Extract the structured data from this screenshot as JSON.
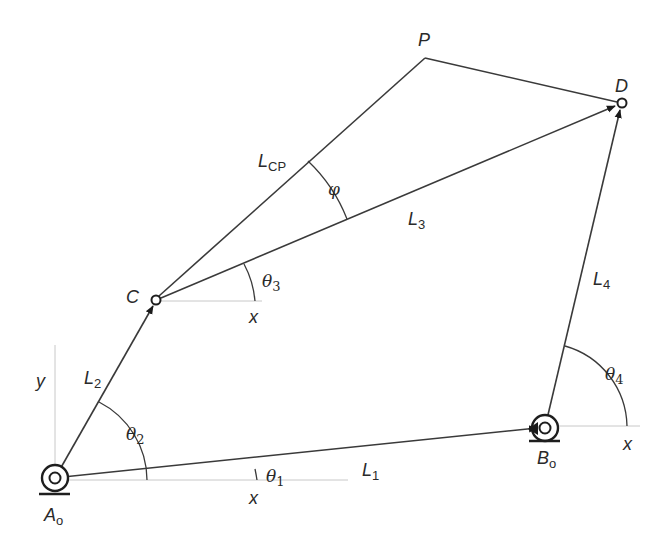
{
  "diagram": {
    "points": {
      "A0": {
        "label": "A",
        "sub": "o",
        "x": 55,
        "y": 478
      },
      "B0": {
        "label": "B",
        "sub": "o",
        "x": 545,
        "y": 428
      },
      "C": {
        "label": "C",
        "x": 156,
        "y": 300
      },
      "D": {
        "label": "D",
        "x": 622,
        "y": 103
      },
      "P": {
        "label": "P",
        "x": 425,
        "y": 58
      }
    },
    "links": [
      {
        "id": "L1",
        "label": "L",
        "sub": "1",
        "from": "A0",
        "to": "B0"
      },
      {
        "id": "L2",
        "label": "L",
        "sub": "2",
        "from": "A0",
        "to": "C"
      },
      {
        "id": "L3",
        "label": "L",
        "sub": "3",
        "from": "C",
        "to": "D"
      },
      {
        "id": "L4",
        "label": "L",
        "sub": "4",
        "from": "B0",
        "to": "D"
      },
      {
        "id": "LCP",
        "label": "L",
        "sub": "CP",
        "from": "C",
        "to": "P"
      },
      {
        "id": "PD",
        "label": "",
        "from": "P",
        "to": "D"
      }
    ],
    "angles": [
      {
        "symbol": "θ",
        "sub": "1"
      },
      {
        "symbol": "θ",
        "sub": "2"
      },
      {
        "symbol": "θ",
        "sub": "3"
      },
      {
        "symbol": "θ",
        "sub": "4"
      },
      {
        "symbol": "φ",
        "sub": ""
      }
    ],
    "axes": {
      "x_label": "x",
      "y_label": "y"
    },
    "colors": {
      "line": "#3a3a3a",
      "axis": "#c8c8c8",
      "text": "#2a2a2a",
      "background": "#ffffff"
    }
  }
}
